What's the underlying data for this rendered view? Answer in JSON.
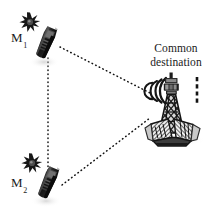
{
  "figure": {
    "type": "network-topology-diagram",
    "background_color": "#ffffff",
    "width": 217,
    "height": 214
  },
  "nodes": {
    "m1": {
      "label_main": "M",
      "label_sub": "1",
      "label_full": "M1",
      "icon": "mobile-handset-icon",
      "burst_icon": "signal-burst-icon",
      "x": 47,
      "y": 45
    },
    "m2": {
      "label_main": "M",
      "label_sub": "2",
      "label_full": "M2",
      "icon": "mobile-handset-icon",
      "burst_icon": "signal-burst-icon",
      "x": 47,
      "y": 185
    },
    "destination": {
      "label_line1": "Common",
      "label_line2": "destination",
      "icon": "radio-tower-icon",
      "x": 172,
      "y": 110
    }
  },
  "links": [
    {
      "name": "m1-to-destination",
      "from": "m1",
      "to": "destination",
      "style": "dotted"
    },
    {
      "name": "m2-to-destination",
      "from": "m2",
      "to": "destination",
      "style": "dotted"
    },
    {
      "name": "m1-to-m2",
      "from": "m1",
      "to": "m2",
      "style": "dotted"
    }
  ],
  "colors": {
    "ink": "#1a1a1a",
    "line": "#111111",
    "handset_dark": "#151515",
    "handset_mid": "#3a3a3a",
    "tower_gray": "#5a5a5a",
    "shadow": "#cfcfcf"
  }
}
